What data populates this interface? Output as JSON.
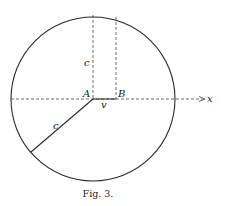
{
  "figure": {
    "caption": "Fig. 3.",
    "labels": {
      "point_a": "A",
      "point_b": "B",
      "segment_ab": "v",
      "vertical_radius": "c",
      "slanted_radius": "c",
      "axis": "x"
    },
    "colors": {
      "stroke": "#2a2a2a",
      "background": "#ffffff"
    }
  }
}
